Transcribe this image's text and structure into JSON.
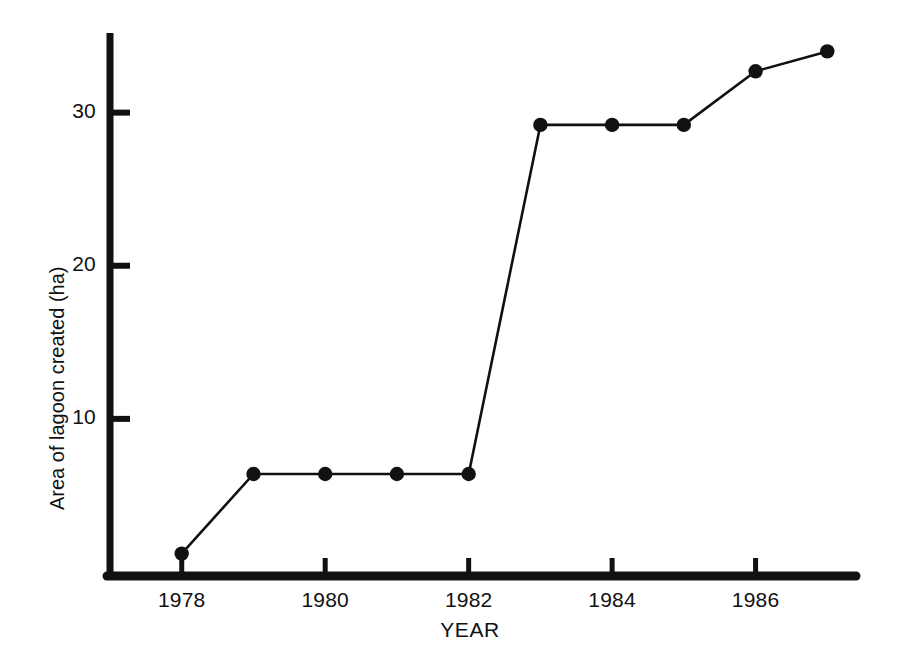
{
  "chart_data": {
    "type": "line",
    "title": "",
    "xlabel": "YEAR",
    "ylabel": "Area of lagoon created (ha)",
    "x": [
      1978,
      1979,
      1980,
      1981,
      1982,
      1983,
      1984,
      1985,
      1986,
      1987
    ],
    "values": [
      1.2,
      6.4,
      6.4,
      6.4,
      6.4,
      29.2,
      29.2,
      29.2,
      32.7,
      34.0
    ],
    "series": [
      {
        "name": "Area of lagoon created",
        "values": [
          1.2,
          6.4,
          6.4,
          6.4,
          6.4,
          29.2,
          29.2,
          29.2,
          32.7,
          34.0
        ]
      }
    ],
    "xlim": [
      1977.0,
      1987.4
    ],
    "ylim": [
      0,
      35.2
    ],
    "xticks": [
      1978,
      1980,
      1982,
      1984,
      1986
    ],
    "xtick_labels": [
      "1978",
      "1980",
      "1982",
      "1984",
      "1986"
    ],
    "yticks": [
      10,
      20,
      30
    ],
    "ytick_labels": [
      "10",
      "20",
      "30"
    ],
    "grid": false,
    "legend": "none",
    "marker": "filled-circle",
    "line_color": "#111111",
    "marker_color": "#111111",
    "axis_color": "#111111",
    "background_color": "#ffffff"
  },
  "axes": {
    "y_title": "Area of lagoon created (ha)",
    "x_title": "YEAR",
    "y_ticks": [
      {
        "label": "30",
        "value": 30
      },
      {
        "label": "20",
        "value": 20
      },
      {
        "label": "10",
        "value": 10
      }
    ],
    "x_ticks": [
      {
        "label": "1978",
        "value": 1978
      },
      {
        "label": "1980",
        "value": 1980
      },
      {
        "label": "1982",
        "value": 1982
      },
      {
        "label": "1984",
        "value": 1984
      },
      {
        "label": "1986",
        "value": 1986
      }
    ]
  },
  "colors": {
    "ink": "#111111",
    "paper": "#ffffff"
  }
}
